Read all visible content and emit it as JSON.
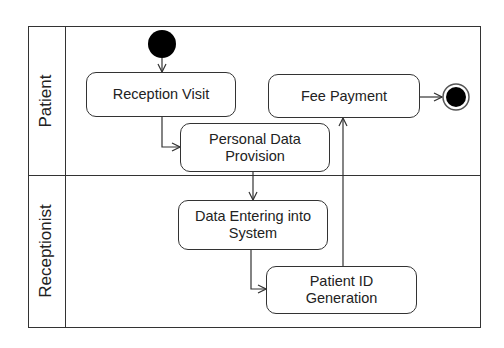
{
  "diagram": {
    "type": "UML activity diagram with swimlanes",
    "lanes": [
      {
        "id": "patient",
        "label": "Patient"
      },
      {
        "id": "receptionist",
        "label": "Receptionist"
      }
    ],
    "nodes": {
      "start": {
        "kind": "initial",
        "lane": "patient"
      },
      "reception_visit": {
        "kind": "action",
        "lane": "patient",
        "label": "Reception Visit"
      },
      "personal_data": {
        "kind": "action",
        "lane": "patient",
        "label_line1": "Personal Data",
        "label_line2": "Provision"
      },
      "data_entering": {
        "kind": "action",
        "lane": "receptionist",
        "label_line1": "Data Entering into",
        "label_line2": "System"
      },
      "patient_id": {
        "kind": "action",
        "lane": "receptionist",
        "label_line1": "Patient ID",
        "label_line2": "Generation"
      },
      "fee_payment": {
        "kind": "action",
        "lane": "patient",
        "label": "Fee Payment"
      },
      "end": {
        "kind": "final",
        "lane": "patient"
      }
    },
    "edges": [
      {
        "from": "start",
        "to": "reception_visit"
      },
      {
        "from": "reception_visit",
        "to": "personal_data"
      },
      {
        "from": "personal_data",
        "to": "data_entering"
      },
      {
        "from": "data_entering",
        "to": "patient_id"
      },
      {
        "from": "patient_id",
        "to": "fee_payment"
      },
      {
        "from": "fee_payment",
        "to": "end"
      }
    ],
    "colors": {
      "line": "#333333",
      "node_fill": "#ffffff",
      "initial_fill": "#000000"
    }
  }
}
